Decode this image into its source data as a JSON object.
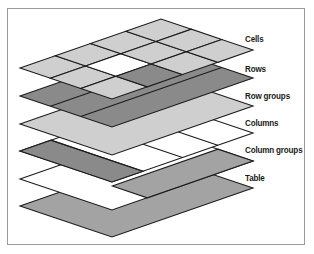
{
  "diagram": {
    "colors": {
      "light": "#cfcfcf",
      "dark": "#8a8a8a",
      "table": "#a3a3a3",
      "white": "#ffffff",
      "stroke": "#1c1c1c",
      "frame": "#9a9a9a"
    },
    "geometry": {
      "left_x": 20,
      "dir_a": [
        141,
        -49
      ],
      "dir_b": [
        92,
        31
      ]
    },
    "layers": [
      {
        "name": "table",
        "label": "Table",
        "left_y": 206,
        "label_pos": [
          245,
          178
        ]
      },
      {
        "name": "column-groups",
        "label": "Column groups",
        "left_y": 179,
        "label_pos": [
          245,
          150
        ]
      },
      {
        "name": "columns",
        "label": "Columns",
        "left_y": 151,
        "label_pos": [
          245,
          123
        ]
      },
      {
        "name": "row-groups",
        "label": "Row groups",
        "left_y": 124,
        "label_pos": [
          245,
          96
        ]
      },
      {
        "name": "rows",
        "label": "Rows",
        "left_y": 96,
        "label_pos": [
          245,
          69
        ]
      },
      {
        "name": "cells",
        "label": "Cells",
        "left_y": 68,
        "label_pos": [
          245,
          39
        ]
      }
    ],
    "caption": ""
  }
}
